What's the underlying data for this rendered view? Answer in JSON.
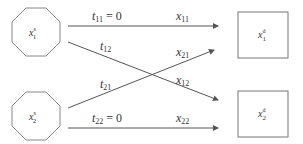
{
  "diagram": {
    "stroke_color": "#777777",
    "text_color": "#333333",
    "sources": [
      {
        "id": "s1",
        "var": "x",
        "sup": "s",
        "sub": "1",
        "shape": "octagon"
      },
      {
        "id": "s2",
        "var": "x",
        "sup": "s",
        "sub": "2",
        "shape": "octagon"
      }
    ],
    "destinations": [
      {
        "id": "d1",
        "var": "x",
        "sup": "d",
        "sub": "1",
        "shape": "square"
      },
      {
        "id": "d2",
        "var": "x",
        "sup": "d",
        "sub": "2",
        "shape": "square"
      }
    ],
    "edges": [
      {
        "from": "s1",
        "to": "d1",
        "t_var": "t",
        "t_sub": "11",
        "t_suffix": " = 0",
        "x_var": "x",
        "x_sub": "11"
      },
      {
        "from": "s1",
        "to": "d2",
        "t_var": "t",
        "t_sub": "12",
        "t_suffix": "",
        "x_var": "x",
        "x_sub": "12"
      },
      {
        "from": "s2",
        "to": "d1",
        "t_var": "t",
        "t_sub": "21",
        "t_suffix": "",
        "x_var": "x",
        "x_sub": "21"
      },
      {
        "from": "s2",
        "to": "d2",
        "t_var": "t",
        "t_sub": "22",
        "t_suffix": " = 0",
        "x_var": "x",
        "x_sub": "22"
      }
    ]
  }
}
